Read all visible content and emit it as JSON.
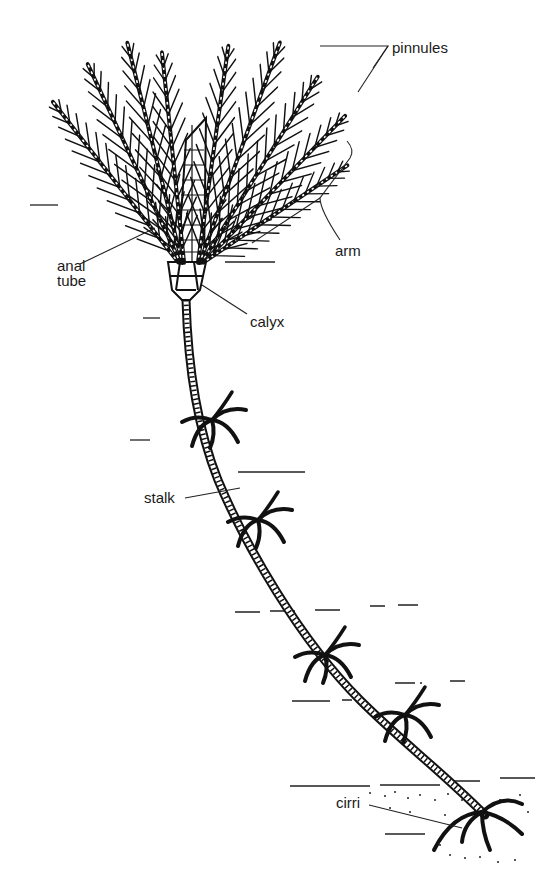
{
  "diagram": {
    "style": "black-and-white line illustration",
    "background": "#ffffff",
    "ink_color": "#111111",
    "labels": [
      {
        "id": "pinnules",
        "text": "pinnules",
        "x": 392,
        "y": 66
      },
      {
        "id": "arm",
        "text": "arm",
        "x": 335,
        "y": 243
      },
      {
        "id": "anal-tube",
        "text": "anal\ntube",
        "x": 57,
        "y": 258
      },
      {
        "id": "calyx",
        "text": "calyx",
        "x": 250,
        "y": 322
      },
      {
        "id": "stalk",
        "text": "stalk",
        "x": 144,
        "y": 492
      },
      {
        "id": "cirri",
        "text": "cirri",
        "x": 336,
        "y": 797
      }
    ]
  }
}
